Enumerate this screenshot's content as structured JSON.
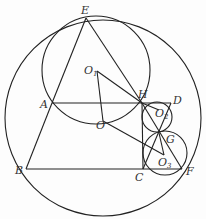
{
  "figure": {
    "type": "geometry",
    "stroke_color": "#222222",
    "background": "#fdfdfd",
    "points": {
      "E": {
        "label": "E",
        "x": 86,
        "y": 18
      },
      "A": {
        "label": "A",
        "x": 52,
        "y": 103
      },
      "B": {
        "label": "B",
        "x": 26,
        "y": 169
      },
      "C": {
        "label": "C",
        "x": 143,
        "y": 169
      },
      "F": {
        "label": "F",
        "x": 182,
        "y": 169
      },
      "H": {
        "label": "H",
        "x": 142,
        "y": 103
      },
      "D": {
        "label": "D",
        "x": 171,
        "y": 103
      },
      "G": {
        "label": "G",
        "x": 159,
        "y": 133
      },
      "O": {
        "label": "O",
        "x": 103,
        "y": 122
      },
      "O1": {
        "label": "O",
        "sub": "1",
        "x": 97,
        "y": 71
      },
      "O2": {
        "label": "O",
        "sub": "2",
        "x": 159,
        "y": 110
      },
      "O3": {
        "label": "O",
        "sub": "3",
        "x": 164,
        "y": 155
      }
    },
    "circles": [
      {
        "name": "circle-O",
        "cx": 103,
        "cy": 118,
        "r": 98
      },
      {
        "name": "circle-O1",
        "cx": 96,
        "cy": 70,
        "r": 54
      },
      {
        "name": "circle-O2",
        "cx": 157,
        "cy": 118,
        "r": 15
      },
      {
        "name": "circle-O3",
        "cx": 165,
        "cy": 153,
        "r": 22
      }
    ],
    "segments": [
      "E-A",
      "E-H",
      "A-B",
      "B-F",
      "A-D",
      "O1-O",
      "O1-H",
      "O-O3",
      "H-F",
      "H-C",
      "G-O3",
      "G-O2",
      "D-G"
    ]
  }
}
